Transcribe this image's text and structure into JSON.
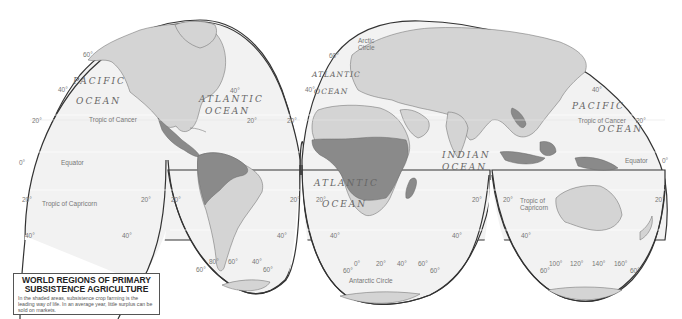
{
  "map": {
    "title": "WORLD REGIONS OF PRIMARY SUBSISTENCE AGRICULTURE",
    "title_line1": "WORLD REGIONS OF PRIMARY",
    "title_line2": "SUBSISTENCE AGRICULTURE",
    "description": "In the shaded areas, subsistence crop farming is the leading way of life. In an average year, little surplus can be sold on markets.",
    "projection": "interrupted (Goode homolosine style)",
    "colors": {
      "ocean": "#f2f2f2",
      "land": "#d4d4d4",
      "subsistence_shaded": "#8a8a8a",
      "outline": "#333333",
      "graticule": "#ffffff"
    },
    "oceans": {
      "pacific_west_1": "PACIFIC",
      "pacific_west_2": "OCEAN",
      "atlantic_north_1": "ATLANTIC",
      "atlantic_north_2": "OCEAN",
      "atlantic_ne_1": "ATLANTIC",
      "atlantic_ne_2": "OCEAN",
      "atlantic_south_1": "ATLANTIC",
      "atlantic_south_2": "OCEAN",
      "indian_1": "INDIAN",
      "indian_2": "OCEAN",
      "pacific_east_1": "PACIFIC",
      "pacific_east_2": "OCEAN"
    },
    "lines": {
      "tropic_cancer": "Tropic of Cancer",
      "equator": "Equator",
      "tropic_capricorn": "Tropic of Capricorn",
      "tropic_of": "Tropic of",
      "capricorn": "Capricorn",
      "arctic_1": "Arctic",
      "arctic_2": "Circle",
      "antarctic": "Antarctic Circle"
    },
    "degrees": {
      "d0": "0°",
      "d20": "20°",
      "d40": "40°",
      "d60": "60°",
      "d80": "80°",
      "d100": "100°",
      "d120": "120°",
      "d140": "140°",
      "d160": "160°"
    },
    "shaded_regions": [
      "Central America",
      "Northern South America (Amazon basin)",
      "Sub-Saharan Africa",
      "Madagascar",
      "Myanmar / Southeast Asia mainland",
      "Indonesia",
      "New Guinea"
    ]
  }
}
